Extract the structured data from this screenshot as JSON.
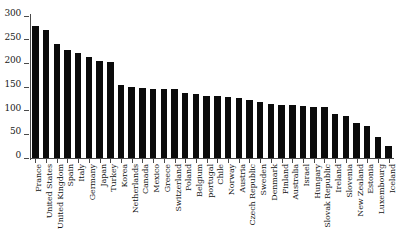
{
  "chart_data": {
    "type": "bar",
    "title": "",
    "subtitle": "",
    "xlabel": "",
    "ylabel": "",
    "ylim": [
      0,
      300
    ],
    "yticks": [
      0,
      50,
      100,
      150,
      200,
      250,
      300
    ],
    "ytick_labels": [
      "0",
      "50",
      "100",
      "150",
      "200",
      "250",
      "300"
    ],
    "grid": false,
    "legend": false,
    "bar_color": "#0b0b0b",
    "axis_color": "#4a4a4a",
    "categories": [
      "France",
      "United States",
      "United Kingdom",
      "Spain",
      "Italy",
      "Germany",
      "Japan",
      "Turkey",
      "Korea",
      "Netherlands",
      "Canada",
      "Mexico",
      "Greece",
      "Switzerland",
      "Poland",
      "Belgium",
      "portugal",
      "Chile",
      "Norway",
      "Austria",
      "Czech Republic",
      "Sweden",
      "Denmark",
      "Finland",
      "Australia",
      "Israel",
      "Hungary",
      "Slovak Republic",
      "Ireland",
      "Slovenia",
      "New Zealand",
      "Estonia",
      "Luxembourg",
      "Iceland"
    ],
    "values": [
      279,
      271,
      241,
      229,
      221,
      214,
      204,
      202,
      154,
      151,
      147,
      146,
      146,
      145,
      138,
      135,
      132,
      130,
      128,
      127,
      122,
      118,
      115,
      113,
      111,
      109,
      108,
      107,
      94,
      88,
      73,
      68,
      45,
      25
    ]
  }
}
